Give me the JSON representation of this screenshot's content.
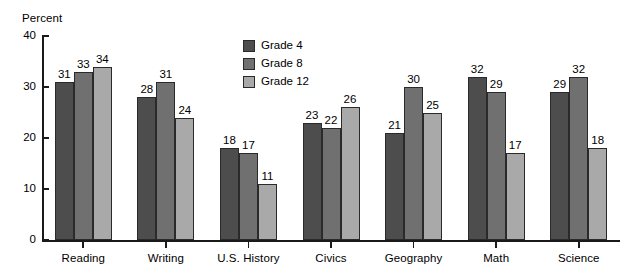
{
  "chart_data": {
    "type": "bar",
    "title": "",
    "xlabel": "",
    "ylabel": "Percent",
    "ylim": [
      0,
      40
    ],
    "yticks": [
      0,
      10,
      20,
      30,
      40
    ],
    "grid": false,
    "legend_position": "inside-top-center",
    "categories": [
      "Reading",
      "Writing",
      "U.S. History",
      "Civics",
      "Geography",
      "Math",
      "Science"
    ],
    "series": [
      {
        "name": "Grade 4",
        "color": "#4d4d4d",
        "values": [
          31,
          28,
          18,
          23,
          21,
          32,
          29
        ]
      },
      {
        "name": "Grade 8",
        "color": "#707070",
        "values": [
          33,
          31,
          17,
          22,
          30,
          29,
          32
        ]
      },
      {
        "name": "Grade 12",
        "color": "#a9a9a9",
        "values": [
          34,
          24,
          11,
          26,
          25,
          17,
          18
        ]
      }
    ]
  },
  "axis": {
    "y_label": "Percent",
    "y_tick_labels": [
      "40",
      "30",
      "20",
      "10",
      "0"
    ]
  },
  "legend": {
    "items": [
      {
        "label": "Grade 4"
      },
      {
        "label": "Grade 8"
      },
      {
        "label": "Grade 12"
      }
    ]
  }
}
